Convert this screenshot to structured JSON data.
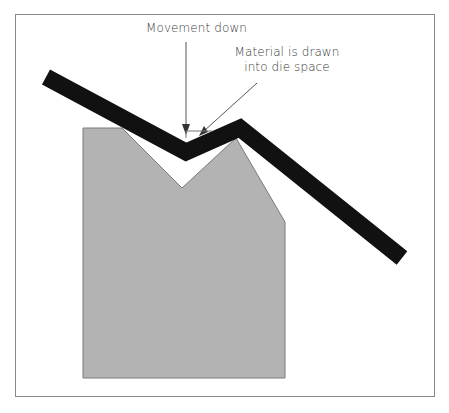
{
  "diagram": {
    "labels": {
      "movement": "Movement down",
      "material_line1": "Material is drawn",
      "material_line2": "into die space"
    },
    "colors": {
      "die_fill": "#b3b3b3",
      "die_stroke": "#7a7a7a",
      "sheet": "#111111",
      "frame": "#8a8a8a",
      "arrow": "#555555",
      "text": "#3a3a3a"
    },
    "elements": [
      {
        "name": "die",
        "shape": "V-notch die block"
      },
      {
        "name": "sheet-material",
        "shape": "thick bent strip"
      },
      {
        "name": "movement-arrow",
        "direction": "down"
      },
      {
        "name": "material-arrow",
        "direction": "down-left"
      }
    ]
  }
}
